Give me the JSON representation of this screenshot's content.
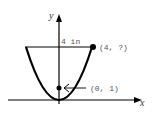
{
  "diagram": {
    "type": "parabola-on-axes",
    "axes": {
      "x_label": "x",
      "y_label": "y"
    },
    "annotations": {
      "width_label": "4 in",
      "top_point_label": "(4, ?)",
      "focus_point_label": "(0, 1)"
    },
    "points": [
      {
        "name": "vertex",
        "x": 0,
        "y": 0
      },
      {
        "name": "focus",
        "x": 0,
        "y": 1,
        "label": "(0, 1)"
      },
      {
        "name": "rim",
        "x": 4,
        "y": "?",
        "label": "(4, ?)"
      }
    ],
    "colors": {
      "curve": "#000000",
      "axis": "#000000",
      "text": "#555555"
    }
  }
}
